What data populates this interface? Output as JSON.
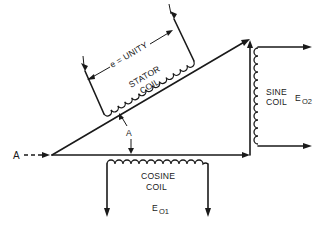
{
  "diagram": {
    "type": "resolver vector diagram",
    "input_label": "A",
    "angle_label": "A",
    "stator": {
      "name_line1": "STATOR",
      "name_line2": "COIL",
      "dimension_label": "e = UNITY"
    },
    "sine_coil": {
      "name_line1": "SINE",
      "name_line2": "COIL",
      "output_symbol": "E",
      "output_subscript": "O2"
    },
    "cosine_coil": {
      "name_line1": "COSINE",
      "name_line2": "COIL",
      "output_symbol": "E",
      "output_subscript": "O1"
    },
    "colors": {
      "ink": "#1a1a1a",
      "background": "#ffffff"
    }
  }
}
